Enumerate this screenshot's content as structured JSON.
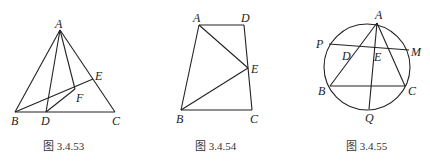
{
  "figures": [
    {
      "caption": "图 3.4.53",
      "points": {
        "A": {
          "label": "A",
          "x": 60,
          "y": 30
        },
        "B": {
          "label": "B",
          "x": 15,
          "y": 112
        },
        "C": {
          "label": "C",
          "x": 115,
          "y": 112
        },
        "D": {
          "label": "D",
          "x": 46,
          "y": 112
        },
        "E": {
          "label": "E",
          "x": 93,
          "y": 79
        },
        "F": {
          "label": "F",
          "x": 75,
          "y": 89
        }
      },
      "segments": [
        "AB",
        "AC",
        "BC",
        "AD",
        "AF",
        "BE",
        "DF"
      ]
    },
    {
      "caption": "图 3.4.54",
      "points": {
        "A": {
          "label": "A",
          "x": 199,
          "y": 25
        },
        "B": {
          "label": "B",
          "x": 181,
          "y": 110
        },
        "C": {
          "label": "C",
          "x": 252,
          "y": 110
        },
        "D": {
          "label": "D",
          "x": 244,
          "y": 25
        },
        "E": {
          "label": "E",
          "x": 248,
          "y": 68
        }
      },
      "segments": [
        "AD",
        "DC",
        "CB",
        "BA",
        "AE",
        "BE"
      ]
    },
    {
      "caption": "图 3.4.55",
      "circle": {
        "cx": 367,
        "cy": 67,
        "r": 43
      },
      "points": {
        "A": {
          "label": "A",
          "x": 377,
          "y": 23
        },
        "P": {
          "label": "P",
          "label_pos": "left",
          "x": 329,
          "y": 44
        },
        "M": {
          "label": "M",
          "x": 409,
          "y": 50
        },
        "B": {
          "label": "B",
          "x": 330,
          "y": 86
        },
        "C": {
          "label": "C",
          "x": 405,
          "y": 86
        },
        "Q": {
          "label": "Q",
          "x": 369,
          "y": 109
        },
        "D": {
          "label": "D",
          "x": 351,
          "y": 46
        },
        "E": {
          "label": "E",
          "x": 374,
          "y": 48
        }
      },
      "segments": [
        "AB",
        "AC",
        "BC",
        "PM",
        "AQ"
      ]
    }
  ]
}
